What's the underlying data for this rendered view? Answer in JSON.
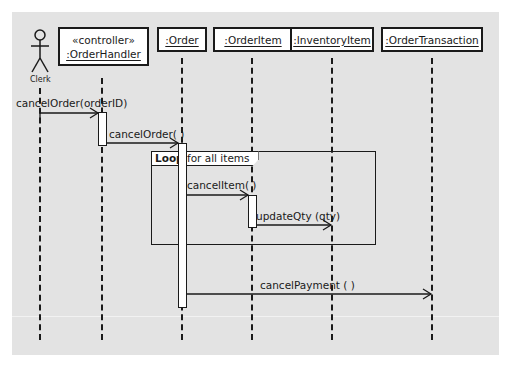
{
  "diagram": {
    "type": "UML sequence diagram",
    "colors": {
      "background": "#e3e3e3",
      "stroke": "#1a1a1a",
      "box_fill": "#ffffff"
    },
    "actor": {
      "name": "Clerk"
    },
    "participants": [
      {
        "stereotype": "«controller»",
        "name": ":OrderHandler"
      },
      {
        "name": ":Order"
      },
      {
        "name": ":OrderItem"
      },
      {
        "name": ":InventoryItem"
      },
      {
        "name": ":OrderTransaction"
      }
    ],
    "messages": [
      {
        "from": "Clerk",
        "to": ":OrderHandler",
        "label": "cancelOrder(orderID)"
      },
      {
        "from": ":OrderHandler",
        "to": ":Order",
        "label": "cancelOrder( )"
      },
      {
        "from": ":Order",
        "to": ":OrderItem",
        "label": "cancelItem( )"
      },
      {
        "from": ":OrderItem",
        "to": ":InventoryItem",
        "label": "updateQty (qty)"
      },
      {
        "from": ":Order",
        "to": ":OrderTransaction",
        "label": "cancelPayment ( )"
      }
    ],
    "loop_frame": {
      "keyword": "Loop",
      "guard": " for all items"
    }
  }
}
